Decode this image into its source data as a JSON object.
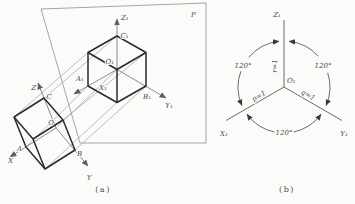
{
  "panel_a": {
    "caption": "(a)",
    "plane_label": "P",
    "axes": {
      "z1": "Z₁",
      "x1": "X₁",
      "y1": "Y₁"
    },
    "points": {
      "o1": "O₁",
      "a1": "A₁",
      "b1": "B₁",
      "c1": "C₁"
    },
    "object_axes": {
      "z": "Z",
      "x": "X",
      "y": "Y"
    },
    "object_points": {
      "o": "O",
      "a": "A",
      "b": "B",
      "c": "C"
    }
  },
  "panel_b": {
    "caption": "(b)",
    "axes": {
      "z1": "Z₁",
      "x1": "X₁",
      "y1": "Y₁"
    },
    "origin": "O₁",
    "angles": {
      "upper_left": "120°",
      "upper_right": "120°",
      "bottom": "120°"
    },
    "scale_coefficients": {
      "x": "p=1",
      "y": "q=1",
      "z": "r=1"
    }
  },
  "colors": {
    "thick_line": "#2b2b2b",
    "thin_line": "#9b9b9b",
    "axis_line": "#6f6f6f",
    "text": "#4a4a4a",
    "background": "#fbfbf9"
  }
}
